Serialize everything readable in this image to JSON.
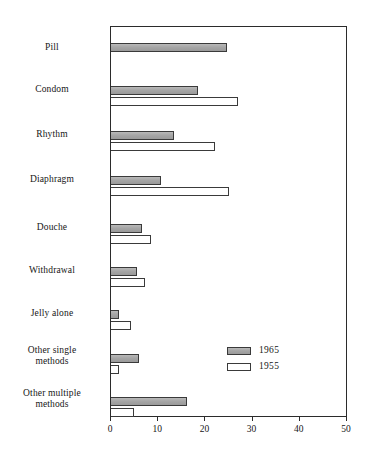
{
  "chart_data": {
    "type": "bar",
    "orientation": "horizontal",
    "title": "",
    "xlabel": "",
    "ylabel": "",
    "xlim": [
      0,
      50
    ],
    "xticks": [
      0,
      10,
      20,
      30,
      40,
      50
    ],
    "xtick_labels": [
      "0",
      "10",
      "20",
      "30",
      "40",
      "50"
    ],
    "grid": false,
    "legend_position": "inside-right-lower",
    "categories": [
      "Pill",
      "Condom",
      "Rhythm",
      "Diaphragm",
      "Douche",
      "Withdrawal",
      "Jelly alone",
      "Other single methods",
      "Other multiple methods"
    ],
    "category_lines": [
      [
        "Pill"
      ],
      [
        "Condom"
      ],
      [
        "Rhythm"
      ],
      [
        "Diaphragm"
      ],
      [
        "Douche"
      ],
      [
        "Withdrawal"
      ],
      [
        "Jelly alone"
      ],
      [
        "Other single",
        "methods"
      ],
      [
        "Other multiple",
        "methods"
      ]
    ],
    "series": [
      {
        "name": "1965",
        "color": "#a6a6a6",
        "values": [
          24.5,
          18.4,
          13.3,
          10.5,
          6.5,
          5.5,
          1.8,
          6.0,
          16.0
        ]
      },
      {
        "name": "1955",
        "color": "#ffffff",
        "values": [
          0,
          27.0,
          22.0,
          25.0,
          8.4,
          7.2,
          4.2,
          1.7,
          4.8
        ]
      }
    ]
  },
  "legend": {
    "entries": [
      {
        "label": "1965",
        "swatch": "gray-filled-swatch"
      },
      {
        "label": "1955",
        "swatch": "white-filled-swatch"
      }
    ]
  }
}
